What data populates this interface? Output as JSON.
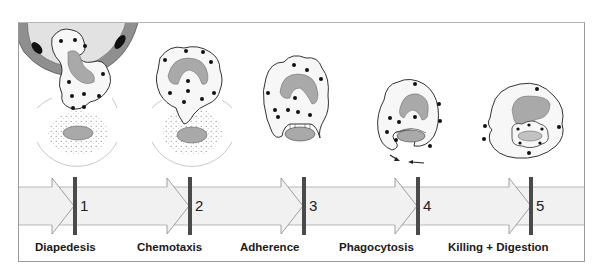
{
  "figure": {
    "colors": {
      "cell_fill": "#f7f7f7",
      "cell_outline": "#333333",
      "nucleus": "#a9a9a9",
      "vessel_wall": "#8f8f8f",
      "vessel_lumen": "#e2e2e2",
      "granule": "#111111",
      "timeline_band": "#f1f1f1",
      "timeline_marker": "#4a4a4a",
      "halo": "#c8c8c8"
    }
  },
  "stages": [
    {
      "number": "1",
      "label": "Diapedesis"
    },
    {
      "number": "2",
      "label": "Chemotaxis"
    },
    {
      "number": "3",
      "label": "Adherence"
    },
    {
      "number": "4",
      "label": "Phagocytosis"
    },
    {
      "number": "5",
      "label": "Killing + Digestion"
    }
  ]
}
